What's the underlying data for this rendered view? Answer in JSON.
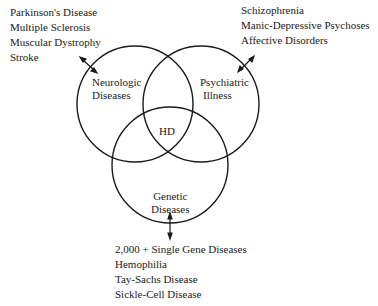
{
  "diagram": {
    "type": "venn",
    "sets": [
      {
        "id": "neurologic",
        "label_lines": [
          "Neurologic",
          "Diseases"
        ],
        "examples": [
          "Parkinson's Disease",
          "Multiple Sclerosis",
          "Muscular Dystrophy",
          "Stroke"
        ]
      },
      {
        "id": "psychiatric",
        "label_lines": [
          "Psychiatric",
          "Illness"
        ],
        "examples": [
          "Schizophrenia",
          "Manic-Depressive Psychoses",
          "Affective Disorders"
        ]
      },
      {
        "id": "genetic",
        "label_lines": [
          "Genetic",
          "Diseases"
        ],
        "examples": [
          "2,000 + Single Gene Diseases",
          "Hemophilia",
          "Tay-Sachs Disease",
          "Sickle-Cell Disease"
        ]
      }
    ],
    "intersection_label": "HD",
    "line_color": "#1a1a1a"
  }
}
